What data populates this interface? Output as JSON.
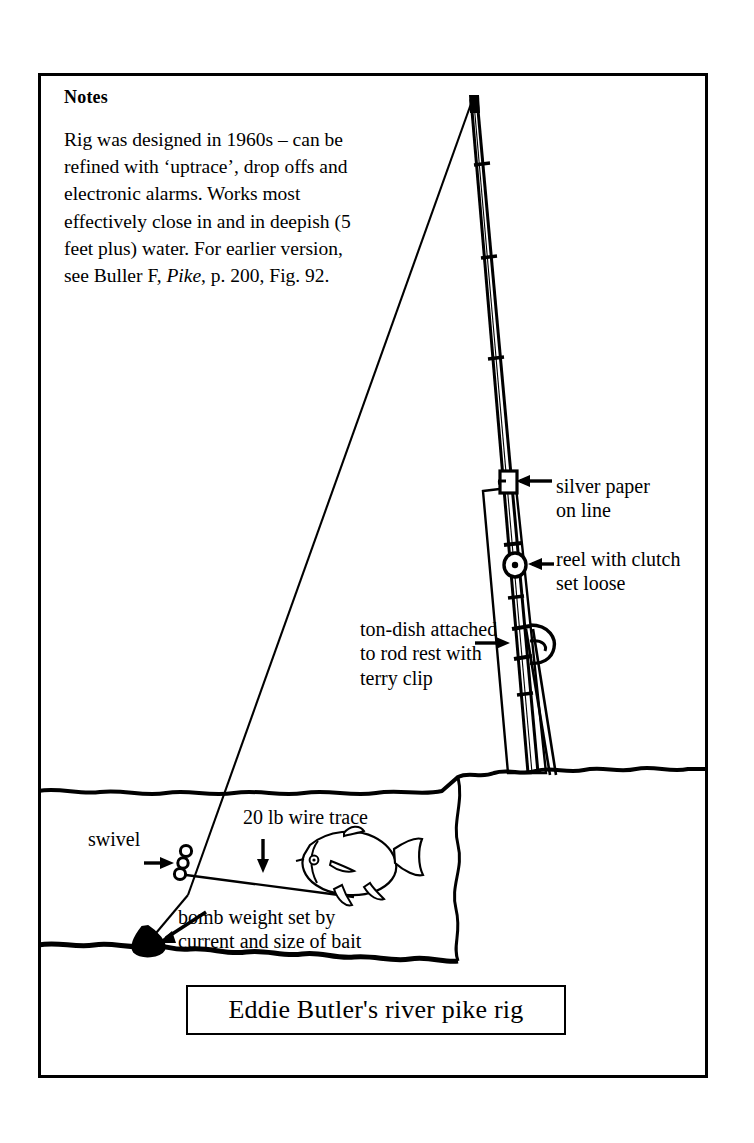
{
  "figure": {
    "caption": "Eddie Butler's river pike rig",
    "notes": {
      "heading": "Notes",
      "line1": "Rig was designed in 1960s – can",
      "line2": "be refined with ‘uptrace’, drop",
      "line3": "offs and electronic alarms. Works",
      "line4": "most effectively close in and in",
      "line5": "deepish (5 feet plus) water. For",
      "line6_pre": "earlier version, see Buller F, ",
      "line6_italic": "Pike",
      "line6_post": ",",
      "line7": "p. 200, Fig. 92."
    },
    "labels": {
      "silver_paper_line1": "silver paper",
      "silver_paper_line2": "on line",
      "reel_line1": "reel with clutch",
      "reel_line2": "set loose",
      "ton_dish_line1": "ton-dish attached",
      "ton_dish_line2": "to rod rest with",
      "ton_dish_line3": "terry clip",
      "swivel": "swivel",
      "wire_trace": "20 lb wire trace",
      "bomb_line1": "bomb weight set by",
      "bomb_line2": "current and size of bait"
    },
    "colors": {
      "ink": "#000000",
      "paper": "#ffffff"
    }
  }
}
